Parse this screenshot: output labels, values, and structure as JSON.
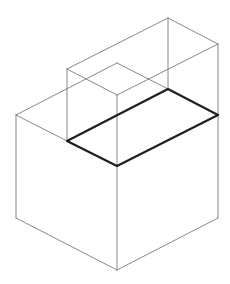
{
  "diagram": {
    "type": "isometric-solid",
    "colors": {
      "background": "#ffffff",
      "thin_edge": "#7a7a7a",
      "bold_edge": "#1e1e1e"
    },
    "vertices": {
      "upper_back_top": [
        168,
        18
      ],
      "upper_right_top": [
        218,
        44
      ],
      "upper_left_top": [
        67,
        69
      ],
      "upper_front_top": [
        117,
        95
      ],
      "upper_inner_top": [
        117,
        63
      ],
      "base_back": [
        168,
        89
      ],
      "base_right": [
        218,
        115
      ],
      "base_left": [
        67,
        141
      ],
      "base_front": [
        117,
        166
      ],
      "lower_left_top": [
        16,
        115
      ],
      "lower_left_bottom": [
        16,
        218
      ],
      "lower_bottom": [
        117,
        270
      ],
      "lower_right_bottom": [
        218,
        218
      ]
    },
    "labels": []
  }
}
